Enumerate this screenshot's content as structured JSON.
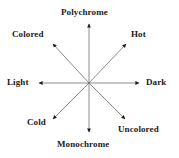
{
  "diagram": {
    "type": "radial-axis-star",
    "title": "",
    "center": {
      "x": 89,
      "y": 83
    },
    "colors": {
      "line": "#6e6e6e",
      "arrowhead": "#1a1a1a",
      "text": "#1a1a1a",
      "background": "#ffffff"
    },
    "axes": [
      {
        "id": "vertical",
        "positive_label": "Polychrome",
        "negative_label": "Monochrome",
        "orientation": "vertical"
      },
      {
        "id": "horizontal",
        "positive_label": "Dark",
        "negative_label": "Light",
        "orientation": "horizontal"
      },
      {
        "id": "diagonal-nwse",
        "positive_label": "Colored",
        "negative_label": "Uncolored",
        "orientation": "diagonal-nw-se"
      },
      {
        "id": "diagonal-nesw",
        "positive_label": "Hot",
        "negative_label": "Cold",
        "orientation": "diagonal-ne-sw"
      }
    ],
    "labels": {
      "polychrome": "Polychrome",
      "monochrome": "Monochrome",
      "light": "Light",
      "dark": "Dark",
      "colored": "Colored",
      "hot": "Hot",
      "cold": "Cold",
      "uncolored": "Uncolored"
    },
    "arrow_endpoints": {
      "up": {
        "x": 89,
        "y": 23
      },
      "down": {
        "x": 89,
        "y": 133
      },
      "left": {
        "x": 38,
        "y": 83
      },
      "right": {
        "x": 140,
        "y": 83
      },
      "upper_left": {
        "x": 52,
        "y": 43
      },
      "upper_right": {
        "x": 127,
        "y": 43
      },
      "lower_left": {
        "x": 52,
        "y": 120
      },
      "lower_right": {
        "x": 126,
        "y": 120
      }
    }
  }
}
